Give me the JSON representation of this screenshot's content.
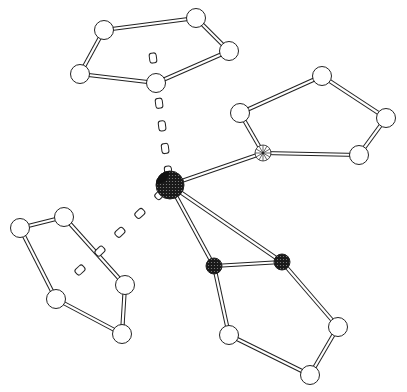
{
  "diagram": {
    "type": "molecular-structure",
    "colors": {
      "background": "#ffffff",
      "stroke": "#222222",
      "open_atom_fill": "#ffffff",
      "metal_fill": "#1a1a1a",
      "dark_atom_fill": "#202020"
    },
    "metal": {
      "x": 170,
      "y": 185,
      "r": 14
    },
    "rings": [
      {
        "name": "ring-top",
        "atoms": [
          [
            104,
            30
          ],
          [
            196,
            18
          ],
          [
            229,
            51
          ],
          [
            156,
            83
          ],
          [
            80,
            74
          ]
        ],
        "centroid": [
          153,
          58
        ]
      },
      {
        "name": "ring-right",
        "atoms": [
          [
            240,
            113
          ],
          [
            322,
            76
          ],
          [
            386,
            118
          ],
          [
            359,
            155
          ],
          [
            263,
            153
          ]
        ],
        "hatched_atom_index": 4
      },
      {
        "name": "ring-left",
        "atoms": [
          [
            20,
            228
          ],
          [
            64,
            217
          ],
          [
            125,
            285
          ],
          [
            122,
            334
          ],
          [
            56,
            299
          ]
        ],
        "centroid": [
          80,
          270
        ]
      },
      {
        "name": "ring-bottom",
        "atoms": [
          [
            214,
            266
          ],
          [
            282,
            262
          ],
          [
            338,
            327
          ],
          [
            310,
            375
          ],
          [
            229,
            335
          ]
        ],
        "dark_atom_indices": [
          0,
          1
        ]
      }
    ],
    "metal_bonds": [
      {
        "to": [
          263,
          153
        ],
        "style": "solid"
      },
      {
        "to": [
          214,
          266
        ],
        "style": "solid"
      },
      {
        "to": [
          282,
          262
        ],
        "style": "solid"
      },
      {
        "to": [
          153,
          58
        ],
        "style": "dashed"
      },
      {
        "to": [
          80,
          270
        ],
        "style": "dashed"
      }
    ]
  }
}
